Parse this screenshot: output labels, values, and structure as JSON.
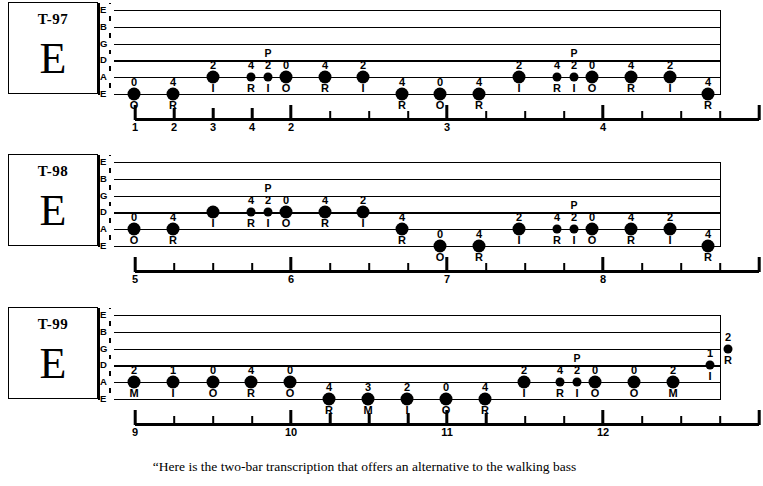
{
  "caption": "“Here is the two-bar transcription that offers an alternative to the walking bass",
  "string_names": [
    "E",
    "B",
    "G",
    "D",
    "A",
    "E"
  ],
  "systems": [
    {
      "id": "T-97",
      "tab_number": "T-97",
      "key": "E",
      "notes": [
        {
          "x": 24,
          "string": 5,
          "fret": "0",
          "finger": "O",
          "artic": "",
          "size": "big"
        },
        {
          "x": 63,
          "string": 5,
          "fret": "4",
          "finger": "R",
          "artic": "",
          "size": "big"
        },
        {
          "x": 103,
          "string": 4,
          "fret": "2",
          "finger": "I",
          "artic": "",
          "size": "big"
        },
        {
          "x": 141,
          "string": 4,
          "fret": "4",
          "finger": "R",
          "artic": "",
          "size": "small"
        },
        {
          "x": 158,
          "string": 4,
          "fret": "2",
          "finger": "I",
          "artic": "P",
          "size": "small"
        },
        {
          "x": 176,
          "string": 4,
          "fret": "0",
          "finger": "O",
          "artic": "",
          "size": "big"
        },
        {
          "x": 215,
          "string": 4,
          "fret": "4",
          "finger": "R",
          "artic": "",
          "size": "big"
        },
        {
          "x": 253,
          "string": 4,
          "fret": "2",
          "finger": "I",
          "artic": "",
          "size": "big"
        },
        {
          "x": 292,
          "string": 5,
          "fret": "4",
          "finger": "R",
          "artic": "",
          "size": "big"
        },
        {
          "x": 330,
          "string": 5,
          "fret": "0",
          "finger": "O",
          "artic": "",
          "size": "big"
        },
        {
          "x": 369,
          "string": 5,
          "fret": "4",
          "finger": "R",
          "artic": "",
          "size": "big"
        },
        {
          "x": 409,
          "string": 4,
          "fret": "2",
          "finger": "I",
          "artic": "",
          "size": "big"
        },
        {
          "x": 447,
          "string": 4,
          "fret": "4",
          "finger": "R",
          "artic": "",
          "size": "small"
        },
        {
          "x": 464,
          "string": 4,
          "fret": "2",
          "finger": "I",
          "artic": "P",
          "size": "small"
        },
        {
          "x": 482,
          "string": 4,
          "fret": "0",
          "finger": "O",
          "artic": "",
          "size": "big"
        },
        {
          "x": 521,
          "string": 4,
          "fret": "4",
          "finger": "R",
          "artic": "",
          "size": "big"
        },
        {
          "x": 560,
          "string": 4,
          "fret": "2",
          "finger": "I",
          "artic": "",
          "size": "big"
        },
        {
          "x": 598,
          "string": 5,
          "fret": "4",
          "finger": "R",
          "artic": "",
          "size": "big"
        }
      ],
      "ruler": {
        "marks": [
          {
            "x": 0,
            "kind": "endcap",
            "label": "1"
          },
          {
            "x": 39,
            "kind": "beat",
            "label": "2"
          },
          {
            "x": 78,
            "kind": "beat",
            "label": "3"
          },
          {
            "x": 117,
            "kind": "beat",
            "label": "4"
          },
          {
            "x": 156,
            "kind": "measure",
            "label": "2"
          },
          {
            "x": 195,
            "kind": "sub",
            "label": ""
          },
          {
            "x": 234,
            "kind": "sub",
            "label": ""
          },
          {
            "x": 273,
            "kind": "sub",
            "label": ""
          },
          {
            "x": 312,
            "kind": "measure",
            "label": "3"
          },
          {
            "x": 351,
            "kind": "sub",
            "label": ""
          },
          {
            "x": 390,
            "kind": "sub",
            "label": ""
          },
          {
            "x": 429,
            "kind": "sub",
            "label": ""
          },
          {
            "x": 468,
            "kind": "measure",
            "label": "4"
          },
          {
            "x": 507,
            "kind": "sub",
            "label": ""
          },
          {
            "x": 546,
            "kind": "sub",
            "label": ""
          },
          {
            "x": 585,
            "kind": "sub",
            "label": ""
          },
          {
            "x": 624,
            "kind": "endcap",
            "label": ""
          }
        ]
      }
    },
    {
      "id": "T-98",
      "tab_number": "T-98",
      "key": "E",
      "notes": [
        {
          "x": 24,
          "string": 4,
          "fret": "0",
          "finger": "O",
          "artic": "",
          "size": "big"
        },
        {
          "x": 63,
          "string": 4,
          "fret": "4",
          "finger": "R",
          "artic": "",
          "size": "big"
        },
        {
          "x": 103,
          "string": 3,
          "fret": "",
          "finger": "I",
          "artic": "",
          "size": "big"
        },
        {
          "x": 141,
          "string": 3,
          "fret": "4",
          "finger": "R",
          "artic": "",
          "size": "small"
        },
        {
          "x": 158,
          "string": 3,
          "fret": "2",
          "finger": "I",
          "artic": "P",
          "size": "small"
        },
        {
          "x": 176,
          "string": 3,
          "fret": "0",
          "finger": "O",
          "artic": "",
          "size": "big"
        },
        {
          "x": 215,
          "string": 3,
          "fret": "4",
          "finger": "R",
          "artic": "",
          "size": "big"
        },
        {
          "x": 253,
          "string": 3,
          "fret": "2",
          "finger": "I",
          "artic": "",
          "size": "big"
        },
        {
          "x": 292,
          "string": 4,
          "fret": "4",
          "finger": "R",
          "artic": "",
          "size": "big"
        },
        {
          "x": 330,
          "string": 5,
          "fret": "0",
          "finger": "O",
          "artic": "",
          "size": "big"
        },
        {
          "x": 369,
          "string": 5,
          "fret": "4",
          "finger": "R",
          "artic": "",
          "size": "big"
        },
        {
          "x": 409,
          "string": 4,
          "fret": "2",
          "finger": "I",
          "artic": "",
          "size": "big"
        },
        {
          "x": 447,
          "string": 4,
          "fret": "4",
          "finger": "R",
          "artic": "",
          "size": "small"
        },
        {
          "x": 464,
          "string": 4,
          "fret": "2",
          "finger": "I",
          "artic": "P",
          "size": "small"
        },
        {
          "x": 482,
          "string": 4,
          "fret": "0",
          "finger": "O",
          "artic": "",
          "size": "big"
        },
        {
          "x": 521,
          "string": 4,
          "fret": "4",
          "finger": "R",
          "artic": "",
          "size": "big"
        },
        {
          "x": 560,
          "string": 4,
          "fret": "2",
          "finger": "I",
          "artic": "",
          "size": "big"
        },
        {
          "x": 598,
          "string": 5,
          "fret": "4",
          "finger": "R",
          "artic": "",
          "size": "big"
        }
      ],
      "ruler": {
        "marks": [
          {
            "x": 0,
            "kind": "endcap",
            "label": "5"
          },
          {
            "x": 39,
            "kind": "sub",
            "label": ""
          },
          {
            "x": 78,
            "kind": "sub",
            "label": ""
          },
          {
            "x": 117,
            "kind": "sub",
            "label": ""
          },
          {
            "x": 156,
            "kind": "measure",
            "label": "6"
          },
          {
            "x": 195,
            "kind": "sub",
            "label": ""
          },
          {
            "x": 234,
            "kind": "sub",
            "label": ""
          },
          {
            "x": 273,
            "kind": "sub",
            "label": ""
          },
          {
            "x": 312,
            "kind": "measure",
            "label": "7"
          },
          {
            "x": 351,
            "kind": "sub",
            "label": ""
          },
          {
            "x": 390,
            "kind": "sub",
            "label": ""
          },
          {
            "x": 429,
            "kind": "sub",
            "label": ""
          },
          {
            "x": 468,
            "kind": "measure",
            "label": "8"
          },
          {
            "x": 507,
            "kind": "sub",
            "label": ""
          },
          {
            "x": 546,
            "kind": "sub",
            "label": ""
          },
          {
            "x": 585,
            "kind": "sub",
            "label": ""
          },
          {
            "x": 624,
            "kind": "endcap",
            "label": ""
          }
        ]
      }
    },
    {
      "id": "T-99",
      "tab_number": "T-99",
      "key": "E",
      "notes": [
        {
          "x": 24,
          "string": 4,
          "fret": "2",
          "finger": "M",
          "artic": "",
          "size": "big"
        },
        {
          "x": 63,
          "string": 4,
          "fret": "1",
          "finger": "I",
          "artic": "",
          "size": "big"
        },
        {
          "x": 103,
          "string": 4,
          "fret": "0",
          "finger": "O",
          "artic": "",
          "size": "big"
        },
        {
          "x": 141,
          "string": 4,
          "fret": "4",
          "finger": "R",
          "artic": "",
          "size": "big"
        },
        {
          "x": 180,
          "string": 4,
          "fret": "0",
          "finger": "O",
          "artic": "",
          "size": "big"
        },
        {
          "x": 219,
          "string": 5,
          "fret": "4",
          "finger": "R",
          "artic": "",
          "size": "big"
        },
        {
          "x": 258,
          "string": 5,
          "fret": "3",
          "finger": "M",
          "artic": "",
          "size": "big"
        },
        {
          "x": 297,
          "string": 5,
          "fret": "2",
          "finger": "I",
          "artic": "",
          "size": "big"
        },
        {
          "x": 336,
          "string": 5,
          "fret": "0",
          "finger": "O",
          "artic": "",
          "size": "big"
        },
        {
          "x": 375,
          "string": 5,
          "fret": "4",
          "finger": "R",
          "artic": "",
          "size": "big"
        },
        {
          "x": 414,
          "string": 4,
          "fret": "2",
          "finger": "I",
          "artic": "",
          "size": "big"
        },
        {
          "x": 450,
          "string": 4,
          "fret": "4",
          "finger": "R",
          "artic": "",
          "size": "small"
        },
        {
          "x": 467,
          "string": 4,
          "fret": "2",
          "finger": "I",
          "artic": "P",
          "size": "small"
        },
        {
          "x": 485,
          "string": 4,
          "fret": "0",
          "finger": "O",
          "artic": "",
          "size": "big"
        },
        {
          "x": 524,
          "string": 4,
          "fret": "0",
          "finger": "O",
          "artic": "",
          "size": "big"
        },
        {
          "x": 563,
          "string": 4,
          "fret": "2",
          "finger": "M",
          "artic": "",
          "size": "big"
        },
        {
          "x": 600,
          "string": 3,
          "fret": "1",
          "finger": "I",
          "artic": "",
          "size": "small"
        },
        {
          "x": 618,
          "string": 2,
          "fret": "2",
          "finger": "R",
          "artic": "",
          "size": "small"
        }
      ],
      "ruler": {
        "marks": [
          {
            "x": 0,
            "kind": "endcap",
            "label": "9"
          },
          {
            "x": 39,
            "kind": "sub",
            "label": ""
          },
          {
            "x": 78,
            "kind": "sub",
            "label": ""
          },
          {
            "x": 117,
            "kind": "sub",
            "label": ""
          },
          {
            "x": 156,
            "kind": "measure",
            "label": "10"
          },
          {
            "x": 195,
            "kind": "beat",
            "label": ""
          },
          {
            "x": 234,
            "kind": "beat",
            "label": ""
          },
          {
            "x": 273,
            "kind": "beat",
            "label": ""
          },
          {
            "x": 312,
            "kind": "measure",
            "label": "11"
          },
          {
            "x": 351,
            "kind": "beat",
            "label": ""
          },
          {
            "x": 390,
            "kind": "sub",
            "label": ""
          },
          {
            "x": 429,
            "kind": "sub",
            "label": ""
          },
          {
            "x": 468,
            "kind": "measure",
            "label": "12"
          },
          {
            "x": 507,
            "kind": "sub",
            "label": ""
          },
          {
            "x": 546,
            "kind": "sub",
            "label": ""
          },
          {
            "x": 585,
            "kind": "sub",
            "label": ""
          },
          {
            "x": 624,
            "kind": "endcap",
            "label": ""
          }
        ]
      }
    }
  ]
}
